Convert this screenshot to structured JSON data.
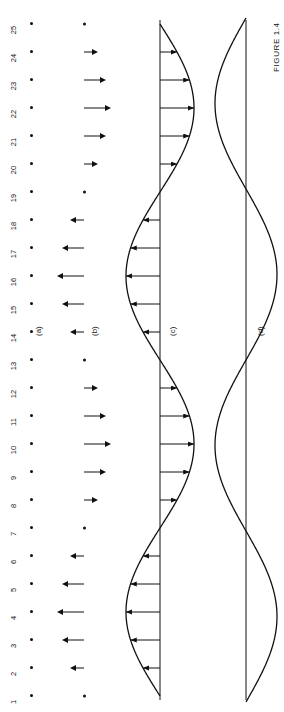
{
  "figure": {
    "caption": "FIGURE 1.4",
    "panels": [
      {
        "id": "a",
        "tag": "(a)",
        "description": "row of numbered particles at rest positions"
      },
      {
        "id": "b",
        "tag": "(b)",
        "description": "instantaneous displacements shown as vertical arrows"
      },
      {
        "id": "c",
        "tag": "(c)",
        "description": "wave profile with transverse velocity arrows"
      },
      {
        "id": "d",
        "tag": "(d)",
        "description": "wave curve crossing the equilibrium line"
      }
    ]
  },
  "panel_a": {
    "tag": "(a)",
    "labels": [
      "1",
      "2",
      "3",
      "4",
      "5",
      "6",
      "7",
      "8",
      "9",
      "10",
      "11",
      "12",
      "13",
      "14",
      "15",
      "16",
      "17",
      "18",
      "19",
      "20",
      "21",
      "22",
      "23",
      "24",
      "25"
    ]
  },
  "panel_b": {
    "tag": "(b)",
    "node_indices": [
      1,
      7,
      13,
      19,
      25
    ],
    "arrows": [
      {
        "index": 1,
        "dir": "none",
        "len": 0
      },
      {
        "index": 2,
        "dir": "up",
        "len": 9
      },
      {
        "index": 3,
        "dir": "up",
        "len": 17
      },
      {
        "index": 4,
        "dir": "up",
        "len": 22
      },
      {
        "index": 5,
        "dir": "up",
        "len": 17
      },
      {
        "index": 6,
        "dir": "up",
        "len": 9
      },
      {
        "index": 7,
        "dir": "none",
        "len": 0
      },
      {
        "index": 8,
        "dir": "down",
        "len": 9
      },
      {
        "index": 9,
        "dir": "down",
        "len": 17
      },
      {
        "index": 10,
        "dir": "down",
        "len": 22
      },
      {
        "index": 11,
        "dir": "down",
        "len": 17
      },
      {
        "index": 12,
        "dir": "down",
        "len": 9
      },
      {
        "index": 13,
        "dir": "none",
        "len": 0
      },
      {
        "index": 14,
        "dir": "up",
        "len": 9
      },
      {
        "index": 15,
        "dir": "up",
        "len": 17
      },
      {
        "index": 16,
        "dir": "up",
        "len": 22
      },
      {
        "index": 17,
        "dir": "up",
        "len": 17
      },
      {
        "index": 18,
        "dir": "up",
        "len": 9
      },
      {
        "index": 19,
        "dir": "none",
        "len": 0
      },
      {
        "index": 20,
        "dir": "down",
        "len": 9
      },
      {
        "index": 21,
        "dir": "down",
        "len": 17
      },
      {
        "index": 22,
        "dir": "down",
        "len": 22
      },
      {
        "index": 23,
        "dir": "down",
        "len": 17
      },
      {
        "index": 24,
        "dir": "down",
        "len": 9
      },
      {
        "index": 25,
        "dir": "none",
        "len": 0
      }
    ]
  },
  "panel_c": {
    "tag": "(c)",
    "curve": "sine",
    "baseline": "horizontal equilibrium line",
    "arrow_indices": [
      2,
      3,
      4,
      5,
      6,
      8,
      9,
      10,
      11,
      12,
      14,
      15,
      16,
      17,
      18,
      20,
      21,
      22,
      23,
      24
    ]
  },
  "panel_d": {
    "tag": "(d)",
    "curves": [
      "sine wave",
      "straight equilibrium line"
    ]
  },
  "chart_data": {
    "type": "line",
    "title": "FIGURE 1.4",
    "xlabel": "",
    "ylabel": "",
    "x": [
      1,
      2,
      3,
      4,
      5,
      6,
      7,
      8,
      9,
      10,
      11,
      12,
      13,
      14,
      15,
      16,
      17,
      18,
      19,
      20,
      21,
      22,
      23,
      24,
      25
    ],
    "series": [
      {
        "name": "(b) displacement",
        "values": [
          0,
          9,
          17,
          22,
          17,
          9,
          0,
          -9,
          -17,
          -22,
          -17,
          -9,
          0,
          9,
          17,
          22,
          17,
          9,
          0,
          -9,
          -17,
          -22,
          -17,
          -9,
          0
        ]
      },
      {
        "name": "(c) wave profile",
        "values": [
          0,
          9,
          17,
          22,
          17,
          9,
          0,
          -9,
          -17,
          -22,
          -17,
          -9,
          0,
          9,
          17,
          22,
          17,
          9,
          0,
          -9,
          -17,
          -22,
          -17,
          -9,
          0
        ]
      },
      {
        "name": "(d) wave curve",
        "values": [
          0,
          -9,
          -17,
          -22,
          -17,
          -9,
          0,
          9,
          17,
          22,
          17,
          9,
          0,
          -9,
          -17,
          -22,
          -17,
          -9,
          0,
          9,
          17,
          22,
          17,
          9,
          0
        ]
      }
    ],
    "ylim": [
      -25,
      25
    ],
    "grid": false,
    "legend": "none"
  }
}
